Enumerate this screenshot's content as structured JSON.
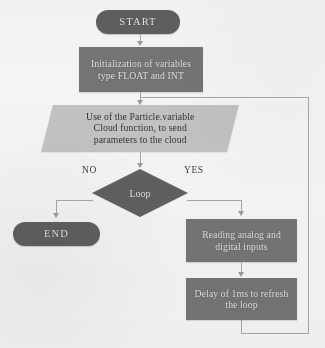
{
  "diagram": {
    "nodes": {
      "start": {
        "label": "START",
        "shape": "terminator"
      },
      "init": {
        "label": "Initialization of variables\ntype FLOAT and INT",
        "shape": "process"
      },
      "cloud": {
        "label": "Use of the Particle.variable\nCloud function, to send\nparameters to the cloud",
        "shape": "input-output"
      },
      "decision": {
        "label": "Loop",
        "shape": "decision"
      },
      "end": {
        "label": "END",
        "shape": "terminator"
      },
      "read_inputs": {
        "label": "Reading analog and\ndigital inputs",
        "shape": "process"
      },
      "delay": {
        "label": "Delay of 1ms to refresh\nthe loop",
        "shape": "process"
      }
    },
    "branch_labels": {
      "no": "NO",
      "yes": "YES"
    },
    "colors": {
      "process_fill": "#747371",
      "terminator_fill": "#5e5d5c",
      "decision_fill": "#5f5e5d",
      "io_fill": "#c6c6c4",
      "connector": "#a9a9a7",
      "page_background": "#fbfbfa",
      "node_text": "#efefef",
      "io_text": "#2e2e2c"
    }
  }
}
